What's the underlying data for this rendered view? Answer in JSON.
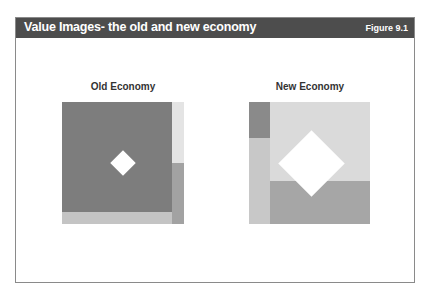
{
  "header": {
    "title": "Value Images- the old and new economy",
    "figure_label": "Figure 9.1"
  },
  "panels": [
    {
      "label": "Old Economy",
      "colors": {
        "main": "#7d7d7d",
        "right_top": "#e4e4e4",
        "right_bottom": "#a2a2a2",
        "bottom": "#c4c4c4"
      }
    },
    {
      "label": "New Economy",
      "colors": {
        "left_top": "#8a8a8a",
        "left_bottom": "#c8c8c8",
        "main_top": "#dadada",
        "main_bottom": "#a6a6a6"
      }
    }
  ]
}
